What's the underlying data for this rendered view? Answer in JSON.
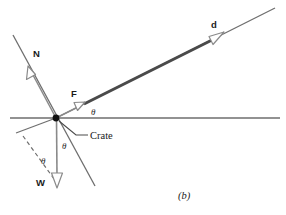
{
  "figure": {
    "panel_label": "(b)",
    "caption_position": "bottom-center",
    "background_color": "#ffffff"
  },
  "colors": {
    "line": "#6e6e6e",
    "vector_stroke": "#8a8a8a",
    "vector_fill": "#ffffff",
    "displacement": "#4a4a4a",
    "text": "#1a1a1a",
    "dot": "#111111"
  },
  "origin": {
    "label": "Crate",
    "x": 56,
    "y": 118,
    "dot_radius": 3.4
  },
  "lines": {
    "horizontal": {
      "name": "horizontal-reference-line",
      "x1": 10,
      "y1": 118,
      "x2": 280,
      "y2": 118,
      "style": "solid"
    },
    "incline": {
      "name": "incline-surface-line",
      "x1": 56,
      "y1": 118,
      "x2": 275,
      "y2": 8,
      "style": "solid"
    },
    "normal_axis": {
      "name": "normal-axis-line",
      "x1": 13,
      "y1": 35,
      "x2": 95,
      "y2": 186,
      "style": "solid"
    },
    "perp_helper": {
      "name": "perpendicular-helper-line",
      "x1": 16,
      "y1": 133,
      "x2": 56,
      "y2": 118,
      "style": "solid"
    },
    "dashed_component": {
      "name": "weight-component-dashed-line",
      "x1": 23,
      "y1": 136,
      "x2": 57,
      "y2": 183,
      "style": "dashed"
    },
    "callout_leader": {
      "name": "crate-callout-leader-line",
      "x1": 59,
      "y1": 121,
      "x2": 76,
      "y2": 135,
      "x3": 86,
      "y3": 135,
      "style": "solid"
    }
  },
  "vectors": [
    {
      "id": "normal-force",
      "label": "N",
      "label_x": 37,
      "label_y": 54,
      "tail_x": 56,
      "tail_y": 118,
      "head_x": 29,
      "head_y": 68,
      "head_width": 7.5,
      "head_length": 10,
      "description": "Normal force, perpendicular to incline, pointing up-left"
    },
    {
      "id": "applied-force",
      "label": "F",
      "label_x": 74,
      "label_y": 94,
      "tail_x": 56,
      "tail_y": 118,
      "head_x": 82,
      "head_y": 105,
      "head_width": 7.5,
      "head_length": 10,
      "description": "Applied force along the incline, pointing up-right"
    },
    {
      "id": "weight",
      "label": "W",
      "label_x": 40,
      "label_y": 184,
      "tail_x": 56,
      "tail_y": 118,
      "head_x": 57,
      "head_y": 186,
      "head_width": 8,
      "head_length": 11,
      "description": "Weight, straight down"
    },
    {
      "id": "displacement",
      "label": "d",
      "label_x": 210,
      "label_y": 25,
      "tail_x": 84,
      "tail_y": 104,
      "head_x": 222,
      "head_y": 35,
      "head_width": 8,
      "head_length": 11,
      "thick": true,
      "description": "Displacement along the incline"
    }
  ],
  "angles": [
    {
      "id": "incline-angle-at-origin",
      "label": "θ",
      "x": 93,
      "y": 112,
      "description": "Angle between incline and horizontal"
    },
    {
      "id": "weight-normal-angle",
      "label": "θ",
      "x": 61,
      "y": 146,
      "description": "Angle between weight vector and normal-axis extension"
    },
    {
      "id": "weight-component-angle",
      "label": "θ",
      "x": 41,
      "y": 161,
      "description": "Angle between weight vector and dashed component line"
    }
  ]
}
